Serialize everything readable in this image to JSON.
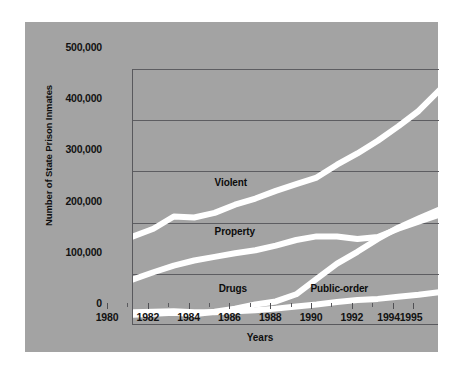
{
  "chart_data": {
    "type": "line",
    "title": "",
    "xlabel": "Years",
    "ylabel": "Number of State Prison Inmates",
    "xlim": [
      1980,
      1995
    ],
    "ylim": [
      0,
      500000
    ],
    "grid": true,
    "legend_position": "inline-labels",
    "y_ticks": [
      {
        "value": 500000,
        "label": "500,000"
      },
      {
        "value": 400000,
        "label": "400,000"
      },
      {
        "value": 300000,
        "label": "300,000"
      },
      {
        "value": 200000,
        "label": "200,000"
      },
      {
        "value": 100000,
        "label": "100,000"
      },
      {
        "value": 0,
        "label": "0"
      }
    ],
    "x_ticks": [
      {
        "value": 1980,
        "label": "1980"
      },
      {
        "value": 1982,
        "label": "1982"
      },
      {
        "value": 1984,
        "label": "1984"
      },
      {
        "value": 1986,
        "label": "1986"
      },
      {
        "value": 1988,
        "label": "1988"
      },
      {
        "value": 1990,
        "label": "1990"
      },
      {
        "value": 1992,
        "label": "1992"
      },
      {
        "value": 1994,
        "label": "1994"
      },
      {
        "value": 1995,
        "label": "1995"
      }
    ],
    "x": [
      1980,
      1981,
      1982,
      1983,
      1984,
      1985,
      1986,
      1987,
      1988,
      1989,
      1990,
      1991,
      1992,
      1993,
      1994,
      1995
    ],
    "series": [
      {
        "name": "Violent",
        "label": "Violent",
        "color": "#ffffff",
        "label_x": 1984.0,
        "label_y": 278000,
        "values": [
          173000,
          188000,
          212000,
          210000,
          219000,
          235000,
          247000,
          262000,
          275000,
          288000,
          313000,
          335000,
          360000,
          388000,
          418000,
          458000
        ]
      },
      {
        "name": "Property",
        "label": "Property",
        "color": "#ffffff",
        "label_x": 1984.0,
        "label_y": 182000,
        "values": [
          89000,
          103000,
          116000,
          126000,
          133000,
          140000,
          146000,
          155000,
          166000,
          173000,
          173000,
          168000,
          172000,
          188000,
          202000,
          215000
        ]
      },
      {
        "name": "Drugs",
        "label": "Drugs",
        "color": "#ffffff",
        "label_x": 1984.2,
        "label_y": 70000,
        "values": [
          20000,
          22000,
          24000,
          21000,
          26000,
          32000,
          40000,
          46000,
          60000,
          90000,
          120000,
          143000,
          168000,
          190000,
          208000,
          225000
        ]
      },
      {
        "name": "Public-order",
        "label": "Public-order",
        "color": "#ffffff",
        "label_x": 1988.7,
        "label_y": 70000,
        "values": [
          25000,
          26000,
          27000,
          25000,
          25000,
          27000,
          29000,
          32000,
          36000,
          40000,
          45000,
          49000,
          51000,
          55000,
          59000,
          64000
        ]
      }
    ]
  },
  "figure": {
    "background": "#ffffff",
    "panel_color": "#a3a3a3",
    "line_color": "#ffffff",
    "axis_color": "#59595d",
    "text_color": "#121212"
  }
}
